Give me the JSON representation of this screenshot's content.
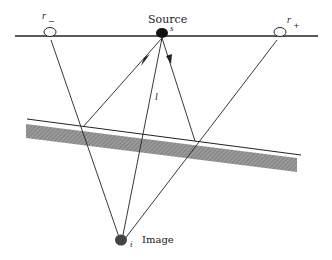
{
  "diagram": {
    "labels": {
      "source": "Source",
      "source_symbol": "s",
      "image": "Image",
      "image_symbol": "i",
      "receiver_minus": "r",
      "receiver_minus_sub": "−",
      "receiver_plus": "r",
      "receiver_plus_sub": "+",
      "path_length": "l"
    },
    "elements": [
      "surface line",
      "source point (filled)",
      "receiver r− (open circle)",
      "receiver r+ (open circle)",
      "dipping reflector with hatched layer",
      "image point (filled)",
      "ray paths from source to reflector to receivers",
      "straight lines from image to receivers"
    ],
    "colors": {
      "line": "#222222",
      "hatch": "#8a8a8a",
      "background": "#ffffff"
    }
  }
}
